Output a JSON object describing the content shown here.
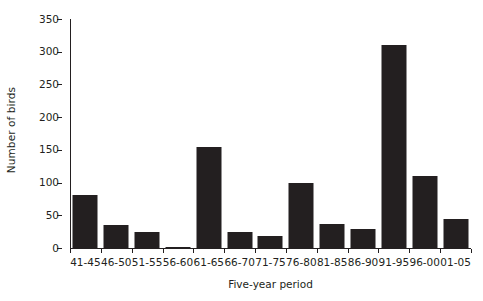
{
  "chart_data": {
    "type": "bar",
    "title": "",
    "subtitle": "",
    "xlabel": "Five-year period",
    "ylabel": "Number of birds",
    "categories": [
      "41-45",
      "46-50",
      "51-55",
      "56-60",
      "61-65",
      "66-70",
      "71-75",
      "76-80",
      "81-85",
      "86-90",
      "91-95",
      "96-00",
      "01-05"
    ],
    "values": [
      81,
      35,
      25,
      2,
      155,
      24,
      19,
      100,
      36,
      29,
      311,
      110,
      45
    ],
    "ylim": [
      0,
      350
    ],
    "ytick_values": [
      0,
      50,
      100,
      150,
      200,
      250,
      300,
      350
    ],
    "ytick_labels": [
      "0",
      "50",
      "100",
      "150",
      "200",
      "250",
      "300",
      "350"
    ],
    "grid": false,
    "legend": null,
    "legend_position": "none",
    "bar_color": "#231f20",
    "axis_color": "#231f20",
    "background": "#ffffff"
  }
}
